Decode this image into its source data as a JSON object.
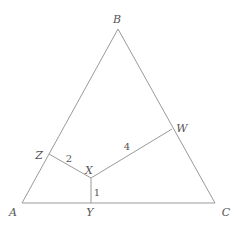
{
  "diagram": {
    "type": "geometry-triangle",
    "colors": {
      "line": "#9a9a9a",
      "text": "#555555",
      "background": "#ffffff"
    },
    "points": {
      "A": {
        "label": "A",
        "x": 22,
        "y": 203,
        "lx": 13,
        "ly": 216
      },
      "B": {
        "label": "B",
        "x": 118,
        "y": 29,
        "lx": 117,
        "ly": 23
      },
      "C": {
        "label": "C",
        "x": 215,
        "y": 203,
        "lx": 226,
        "ly": 216
      },
      "X": {
        "label": "X",
        "x": 91,
        "y": 178,
        "lx": 89,
        "ly": 174
      },
      "Y": {
        "label": "Y",
        "x": 91,
        "y": 203,
        "lx": 90,
        "ly": 216
      },
      "Z": {
        "label": "Z",
        "x": 49,
        "y": 154,
        "lx": 39,
        "ly": 159
      },
      "W": {
        "label": "W",
        "x": 172,
        "y": 129,
        "lx": 182,
        "ly": 132
      }
    },
    "segments": [
      {
        "from": "A",
        "to": "B"
      },
      {
        "from": "B",
        "to": "C"
      },
      {
        "from": "A",
        "to": "C"
      },
      {
        "from": "X",
        "to": "Y",
        "length_label": "1",
        "lx": 97,
        "ly": 196
      },
      {
        "from": "X",
        "to": "Z",
        "length_label": "2",
        "lx": 69,
        "ly": 162
      },
      {
        "from": "X",
        "to": "W",
        "length_label": "4",
        "lx": 127,
        "ly": 150
      }
    ]
  }
}
